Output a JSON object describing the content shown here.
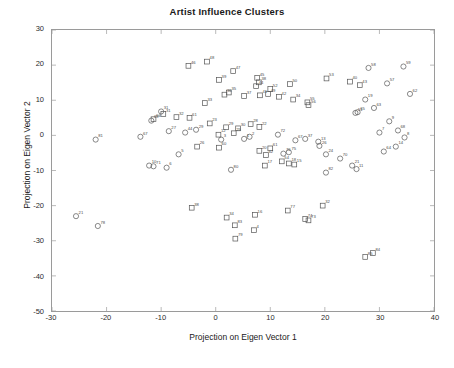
{
  "chart_data": {
    "type": "scatter",
    "title": "Artist Influence Clusters",
    "xlabel": "Projection on Eigen Vector 1",
    "ylabel": "Projection on Eigen Vector 2",
    "xlim": [
      -30,
      40
    ],
    "ylim": [
      -50,
      30
    ],
    "xticks": [
      -30,
      -20,
      -10,
      0,
      10,
      20,
      30,
      40
    ],
    "yticks": [
      -50,
      -40,
      -30,
      -20,
      -10,
      0,
      10,
      20,
      30
    ],
    "grid": false,
    "legend": null,
    "marker_colors": {
      "circle": "#555555",
      "square": "#555555"
    },
    "series": [
      {
        "name": "cluster-square",
        "marker": "square",
        "points": [
          {
            "label": "46",
            "x": -5.0,
            "y": 19.8
          },
          {
            "label": "48",
            "x": -1.6,
            "y": 21.0
          },
          {
            "label": "47",
            "x": 3.2,
            "y": 18.3
          },
          {
            "label": "39",
            "x": 0.6,
            "y": 15.8
          },
          {
            "label": "45",
            "x": 7.6,
            "y": 16.4
          },
          {
            "label": "38",
            "x": 7.9,
            "y": 15.1
          },
          {
            "label": "44",
            "x": 7.4,
            "y": 14.0
          },
          {
            "label": "52",
            "x": 10.0,
            "y": 13.2
          },
          {
            "label": "50",
            "x": 13.6,
            "y": 14.6
          },
          {
            "label": "53",
            "x": 20.3,
            "y": 16.2
          },
          {
            "label": "40",
            "x": 24.6,
            "y": 15.3
          },
          {
            "label": "43",
            "x": 26.4,
            "y": 14.3
          },
          {
            "label": "36",
            "x": 1.6,
            "y": 11.6
          },
          {
            "label": "35",
            "x": 2.4,
            "y": 12.2
          },
          {
            "label": "37",
            "x": 5.2,
            "y": 11.2
          },
          {
            "label": "41",
            "x": 8.1,
            "y": 11.4
          },
          {
            "label": "49",
            "x": 9.6,
            "y": 11.8
          },
          {
            "label": "42",
            "x": 11.6,
            "y": 11.0
          },
          {
            "label": "34",
            "x": 14.2,
            "y": 10.2
          },
          {
            "label": "55",
            "x": 16.8,
            "y": 9.4
          },
          {
            "label": "56",
            "x": 17.0,
            "y": 8.6
          },
          {
            "label": "33",
            "x": -2.0,
            "y": 9.2
          },
          {
            "label": "31",
            "x": -9.6,
            "y": 6.1
          },
          {
            "label": "66",
            "x": -11.4,
            "y": 4.6
          },
          {
            "label": "32",
            "x": -7.2,
            "y": 5.2
          },
          {
            "label": "61",
            "x": -4.8,
            "y": 5.0
          },
          {
            "label": "23",
            "x": -1.1,
            "y": 3.4
          },
          {
            "label": "29",
            "x": 1.9,
            "y": 2.3
          },
          {
            "label": "30",
            "x": 4.1,
            "y": 2.0
          },
          {
            "label": "28",
            "x": 6.4,
            "y": 3.2
          },
          {
            "label": "22",
            "x": 8.0,
            "y": 2.4
          },
          {
            "label": "12",
            "x": 0.5,
            "y": 0.2
          },
          {
            "label": "25",
            "x": 3.3,
            "y": 0.6
          },
          {
            "label": "26",
            "x": -3.4,
            "y": -3.2
          },
          {
            "label": "60",
            "x": 0.6,
            "y": -3.5
          },
          {
            "label": "20",
            "x": 8.0,
            "y": -4.4
          },
          {
            "label": "61b",
            "x": 10.0,
            "y": -3.7
          },
          {
            "label": "42b",
            "x": 9.2,
            "y": -5.6
          },
          {
            "label": "54",
            "x": 12.1,
            "y": -7.4
          },
          {
            "label": "17",
            "x": 9.0,
            "y": -8.6
          },
          {
            "label": "18",
            "x": 13.4,
            "y": -8.0
          },
          {
            "label": "15",
            "x": 14.4,
            "y": -8.3
          },
          {
            "label": "38b",
            "x": -4.4,
            "y": -20.6
          },
          {
            "label": "34b",
            "x": 2.0,
            "y": -23.4
          },
          {
            "label": "83",
            "x": 3.5,
            "y": -25.6
          },
          {
            "label": "16",
            "x": 7.2,
            "y": -22.6
          },
          {
            "label": "4",
            "x": 7.0,
            "y": -27.0
          },
          {
            "label": "79",
            "x": 3.6,
            "y": -29.4
          },
          {
            "label": "77",
            "x": 13.2,
            "y": -21.4
          },
          {
            "label": "74",
            "x": 16.4,
            "y": -23.8
          },
          {
            "label": "73",
            "x": 17.0,
            "y": -24.2
          },
          {
            "label": "32b",
            "x": 19.6,
            "y": -20.0
          },
          {
            "label": "84",
            "x": 28.8,
            "y": -33.5
          },
          {
            "label": "85",
            "x": 27.4,
            "y": -34.6
          }
        ]
      },
      {
        "name": "cluster-circle",
        "marker": "circle",
        "points": [
          {
            "label": "58",
            "x": 28.0,
            "y": 19.2
          },
          {
            "label": "59",
            "x": 34.4,
            "y": 19.6
          },
          {
            "label": "57",
            "x": 31.4,
            "y": 14.8
          },
          {
            "label": "62",
            "x": 35.6,
            "y": 11.8
          },
          {
            "label": "19",
            "x": 27.4,
            "y": 10.2
          },
          {
            "label": "51",
            "x": 25.6,
            "y": 6.4
          },
          {
            "label": "65",
            "x": 26.0,
            "y": 6.6
          },
          {
            "label": "63",
            "x": 29.0,
            "y": 7.8
          },
          {
            "label": "9",
            "x": 31.8,
            "y": 4.0
          },
          {
            "label": "7",
            "x": 30.0,
            "y": 0.8
          },
          {
            "label": "68",
            "x": 33.4,
            "y": 1.4
          },
          {
            "label": "8",
            "x": 34.6,
            "y": -0.6
          },
          {
            "label": "14",
            "x": 33.0,
            "y": -3.2
          },
          {
            "label": "64",
            "x": 30.8,
            "y": -4.6
          },
          {
            "label": "13",
            "x": 18.8,
            "y": -1.8
          },
          {
            "label": "37b",
            "x": 16.4,
            "y": -1.0
          },
          {
            "label": "67",
            "x": 14.6,
            "y": -1.4
          },
          {
            "label": "24",
            "x": 20.2,
            "y": -5.4
          },
          {
            "label": "70",
            "x": 22.8,
            "y": -6.6
          },
          {
            "label": "21",
            "x": 25.0,
            "y": -8.6
          },
          {
            "label": "11",
            "x": 25.8,
            "y": -9.6
          },
          {
            "label": "26b",
            "x": 19.0,
            "y": -3.0
          },
          {
            "label": "31b",
            "x": -10.0,
            "y": 6.8
          },
          {
            "label": "69",
            "x": -11.8,
            "y": 4.2
          },
          {
            "label": "27",
            "x": -8.6,
            "y": 1.2
          },
          {
            "label": "44b",
            "x": -5.6,
            "y": 0.8
          },
          {
            "label": "29b",
            "x": -3.6,
            "y": 1.6
          },
          {
            "label": "67b",
            "x": -13.8,
            "y": -0.4
          },
          {
            "label": "5",
            "x": -6.8,
            "y": -5.4
          },
          {
            "label": "10",
            "x": -12.2,
            "y": -8.6
          },
          {
            "label": "71",
            "x": -11.4,
            "y": -8.8
          },
          {
            "label": "6",
            "x": -9.0,
            "y": -9.2
          },
          {
            "label": "3",
            "x": 1.0,
            "y": -1.2
          },
          {
            "label": "1",
            "x": 5.2,
            "y": -1.0
          },
          {
            "label": "2",
            "x": 6.2,
            "y": -0.4
          },
          {
            "label": "72",
            "x": 11.4,
            "y": 0.2
          },
          {
            "label": "75",
            "x": 13.4,
            "y": -4.8
          },
          {
            "label": "76",
            "x": 12.4,
            "y": -5.2
          },
          {
            "label": "81",
            "x": -22.0,
            "y": -1.2
          },
          {
            "label": "21b",
            "x": -25.6,
            "y": -23.0
          },
          {
            "label": "78",
            "x": -21.6,
            "y": -25.8
          },
          {
            "label": "82",
            "x": 20.2,
            "y": -10.6
          },
          {
            "label": "80",
            "x": 2.8,
            "y": -9.8
          }
        ]
      }
    ]
  },
  "axes": {
    "xtick_labels": [
      "-30",
      "-20",
      "-10",
      "0",
      "10",
      "20",
      "30",
      "40"
    ],
    "ytick_labels": [
      "30",
      "20",
      "10",
      "0",
      "-10",
      "-20",
      "-30",
      "-40",
      "-50"
    ]
  }
}
